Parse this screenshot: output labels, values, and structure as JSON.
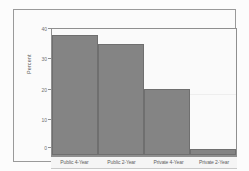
{
  "chart_data": {
    "type": "bar",
    "title": "",
    "subtitle": "",
    "xlabel": "",
    "ylabel": "Percent",
    "categories": [
      "Public 4-Year",
      "Public 2-Year",
      "Private 4-Year",
      "Private 2-Year"
    ],
    "values": [
      40,
      37,
      22,
      2
    ],
    "series": [
      {
        "name": "Percent",
        "values": [
          40,
          37,
          22,
          2
        ]
      }
    ],
    "ylim": [
      0,
      42
    ],
    "yticks": [
      0,
      10,
      20,
      30,
      40
    ],
    "ytick_labels": [
      "0",
      "10",
      "20",
      "30",
      "40"
    ],
    "xlim": [
      0,
      4
    ],
    "grid": true,
    "gridlines_at": [
      20
    ],
    "legend": false,
    "legend_position": "none",
    "bar_gap": 0,
    "orientation": "vertical",
    "annotations": []
  },
  "style": {
    "bar_fill": "#848484",
    "bar_stroke": "#6f6f6f",
    "plot_background": "#fafafa",
    "figure_background": "#fbfbfb",
    "frame_color": "#9a9a9a",
    "axis_color": "#8f8f8f",
    "grid_color": "#eeeeee",
    "tick_label_color": "#707070",
    "axis_title_color": "#5e5e5e",
    "page_background": "#fcfcfc"
  }
}
